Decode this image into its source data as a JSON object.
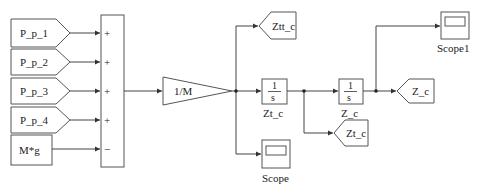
{
  "diagram": {
    "type": "simulink-block-diagram",
    "colors": {
      "stroke": "#555555",
      "wire": "#444444",
      "text": "#222222",
      "background": "#ffffff"
    },
    "from_blocks": [
      {
        "label": "P_p_1"
      },
      {
        "label": "P_p_2"
      },
      {
        "label": "P_p_3"
      },
      {
        "label": "P_p_4"
      }
    ],
    "constant": {
      "label": "M*g"
    },
    "sum": {
      "signs": [
        "+",
        "+",
        "+",
        "+",
        "−"
      ]
    },
    "gain": {
      "label": "1/M"
    },
    "goto_ztt": {
      "label": "Ztt_c"
    },
    "scope": {
      "label": "Scope"
    },
    "integrator1": {
      "num": "1",
      "den": "s",
      "name": "Zt_c"
    },
    "integrator2": {
      "num": "1",
      "den": "s",
      "name": "Z_c"
    },
    "goto_zt": {
      "label": "Zt_c"
    },
    "goto_z": {
      "label": "Z_c"
    },
    "scope1": {
      "label": "Scope1"
    }
  }
}
